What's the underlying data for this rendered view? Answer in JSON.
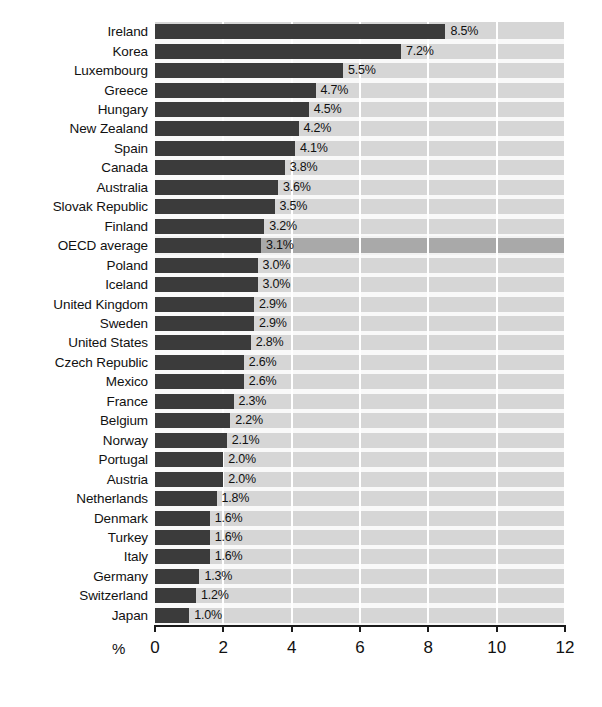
{
  "chart_data": {
    "type": "bar",
    "orientation": "horizontal",
    "title": "",
    "subtitle": "",
    "xlabel": "%",
    "ylabel": "",
    "xlim": [
      0,
      12
    ],
    "xticks": [
      0,
      2,
      4,
      6,
      8,
      10,
      12
    ],
    "xtick_labels": [
      "0",
      "2",
      "4",
      "6",
      "8",
      "10",
      "12"
    ],
    "grid": true,
    "grid_orientation": "vertical",
    "legend": null,
    "value_label_suffix": "%",
    "highlight_category": "OECD average",
    "categories": [
      "Ireland",
      "Korea",
      "Luxembourg",
      "Greece",
      "Hungary",
      "New Zealand",
      "Spain",
      "Canada",
      "Australia",
      "Slovak Republic",
      "Finland",
      "OECD average",
      "Poland",
      "Iceland",
      "United Kingdom",
      "Sweden",
      "United States",
      "Czech Republic",
      "Mexico",
      "France",
      "Belgium",
      "Norway",
      "Portugal",
      "Austria",
      "Netherlands",
      "Denmark",
      "Turkey",
      "Italy",
      "Germany",
      "Switzerland",
      "Japan"
    ],
    "values": [
      8.5,
      7.2,
      5.5,
      4.7,
      4.5,
      4.2,
      4.1,
      3.8,
      3.6,
      3.5,
      3.2,
      3.1,
      3.0,
      3.0,
      2.9,
      2.9,
      2.8,
      2.6,
      2.6,
      2.3,
      2.2,
      2.1,
      2.0,
      2.0,
      1.8,
      1.6,
      1.6,
      1.6,
      1.3,
      1.2,
      1.0
    ],
    "value_labels": [
      "8.5%",
      "7.2%",
      "5.5%",
      "4.7%",
      "4.5%",
      "4.2%",
      "4.1%",
      "3.8%",
      "3.6%",
      "3.5%",
      "3.2%",
      "3.1%",
      "3.0%",
      "3.0%",
      "2.9%",
      "2.9%",
      "2.8%",
      "2.6%",
      "2.6%",
      "2.3%",
      "2.2%",
      "2.1%",
      "2.0%",
      "2.0%",
      "1.8%",
      "1.6%",
      "1.6%",
      "1.6%",
      "1.3%",
      "1.2%",
      "1.0%"
    ]
  },
  "colors": {
    "bar": "#3b3b3b",
    "plot_background": "#d6d6d6",
    "highlight_band": "#a9a9a9",
    "gridline": "#ffffff",
    "axis": "#1a1a1a",
    "text": "#111111",
    "page_background": "#ffffff"
  }
}
